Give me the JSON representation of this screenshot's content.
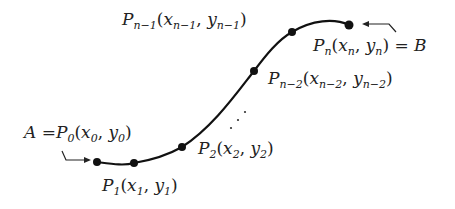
{
  "diagram": {
    "curve_color": "#111111",
    "points": [
      {
        "id": "P0",
        "label_main": "P",
        "sub": "0",
        "args": [
          "x",
          "0",
          "y",
          "0"
        ],
        "prefix": "A =",
        "suffix": "",
        "dot": [
          97,
          162
        ]
      },
      {
        "id": "P1",
        "label_main": "P",
        "sub": "1",
        "args": [
          "x",
          "1",
          "y",
          "1"
        ],
        "prefix": "",
        "suffix": "",
        "dot": [
          134,
          163
        ]
      },
      {
        "id": "P2",
        "label_main": "P",
        "sub": "2",
        "args": [
          "x",
          "2",
          "y",
          "2"
        ],
        "prefix": "",
        "suffix": "",
        "dot": [
          182,
          147
        ]
      },
      {
        "id": "Pn-2",
        "label_main": "P",
        "sub": "n−2",
        "args": [
          "x",
          "n−2",
          "y",
          "n−2"
        ],
        "prefix": "",
        "suffix": "",
        "dot": [
          254,
          71
        ]
      },
      {
        "id": "Pn-1",
        "label_main": "P",
        "sub": "n−1",
        "args": [
          "x",
          "n−1",
          "y",
          "n−1"
        ],
        "prefix": "",
        "suffix": "",
        "dot": [
          292,
          32
        ]
      },
      {
        "id": "Pn",
        "label_main": "P",
        "sub": "n",
        "args": [
          "x",
          "n",
          "y",
          "n"
        ],
        "prefix": "",
        "suffix": "= B",
        "dot": [
          349,
          25
        ]
      }
    ],
    "ellipsis": "⋰",
    "labels": {
      "p0": "A = P₀(x₀, y₀)",
      "p1": "P₁(x₁, y₁)",
      "p2": "P₂(x₂, y₂)",
      "pn2": "Pₙ₋₂(xₙ₋₂, yₙ₋₂)",
      "pn1": "Pₙ₋₁(xₙ₋₁, yₙ₋₁)",
      "pn": "Pₙ(xₙ, yₙ) = B"
    },
    "text": {
      "A": "A",
      "eq": "=",
      "B": "B",
      "P": "P",
      "x": "x",
      "y": "y",
      "comma": ",",
      "open": "(",
      "close": ")",
      "s0": "0",
      "s1": "1",
      "s2": "2",
      "sn": "n",
      "sn1": "n−1",
      "sn2": "n−2"
    }
  }
}
